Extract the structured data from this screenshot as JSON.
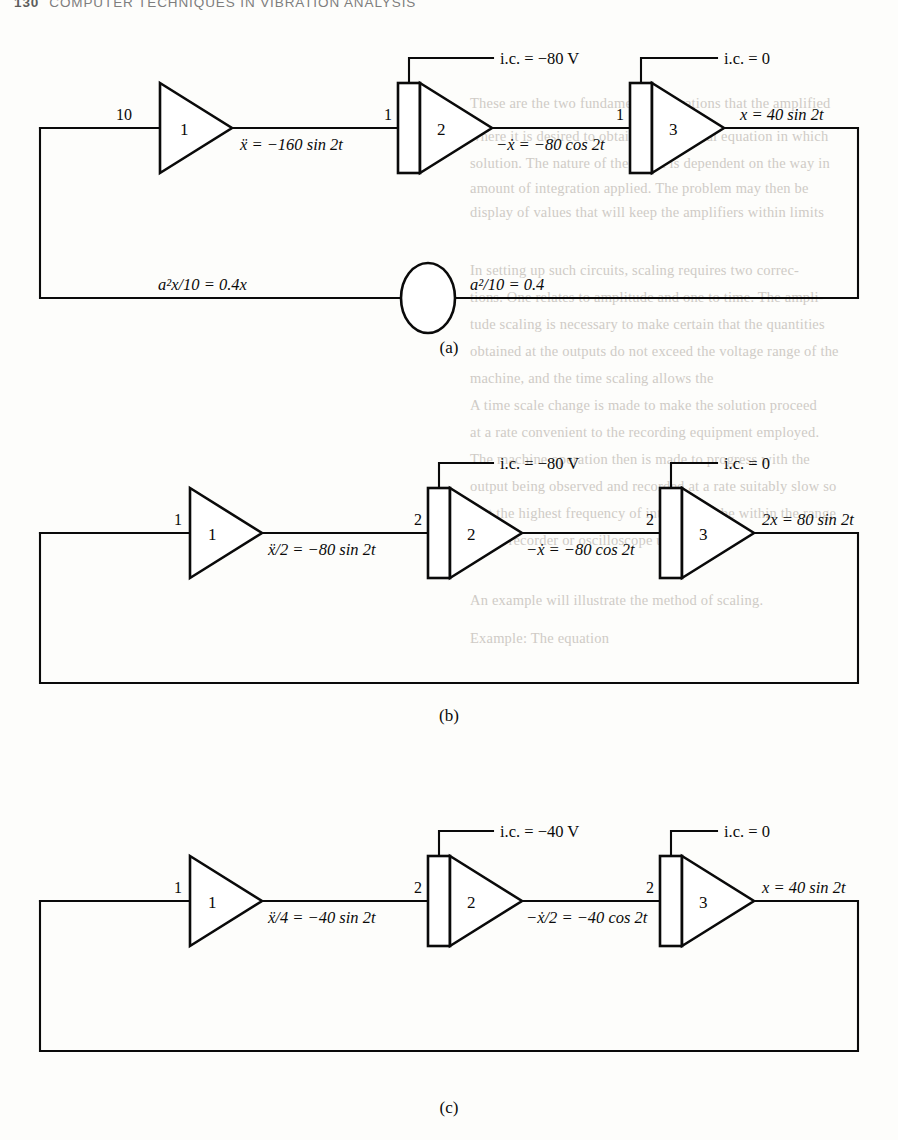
{
  "page": {
    "folio": "130",
    "running_head": "COMPUTER TECHNIQUES IN VIBRATION ANALYSIS",
    "width": 898,
    "height": 1140,
    "ink_color": "#0a0a0a",
    "paper_color": "#fdfdfb"
  },
  "diagrams": [
    {
      "caption": "(a)",
      "input_gain": "10",
      "amplifier": {
        "block_number": "1",
        "output_label": "ẍ = −160 sin 2t"
      },
      "integrator1": {
        "block_number": "2",
        "input_gain": "1",
        "ic_label": "i.c. = −80 V",
        "output_label": "−ẋ = −80 cos 2t"
      },
      "integrator2": {
        "block_number": "3",
        "input_gain": "1",
        "ic_label": "i.c. = 0",
        "output_label": "x = 40 sin 2t"
      },
      "feedback": {
        "left_label": "a²x/10 = 0.4x",
        "right_label": "a²/10 = 0.4",
        "has_potentiometer": true
      }
    },
    {
      "caption": "(b)",
      "input_gain": "1",
      "amplifier": {
        "block_number": "1",
        "output_label": "ẍ/2 = −80 sin 2t"
      },
      "integrator1": {
        "block_number": "2",
        "input_gain": "2",
        "ic_label": "i.c. = −80 V",
        "output_label": "−ẋ = −80 cos 2t"
      },
      "integrator2": {
        "block_number": "3",
        "input_gain": "2",
        "ic_label": "i.c. = 0",
        "output_label": "2x = 80 sin 2t"
      },
      "feedback": {
        "left_label": "",
        "right_label": "",
        "has_potentiometer": false
      }
    },
    {
      "caption": "(c)",
      "input_gain": "1",
      "amplifier": {
        "block_number": "1",
        "output_label": "ẍ/4 = −40 sin 2t"
      },
      "integrator1": {
        "block_number": "2",
        "input_gain": "2",
        "ic_label": "i.c. = −40 V",
        "output_label": "−ẋ/2 = −40 cos 2t"
      },
      "integrator2": {
        "block_number": "3",
        "input_gain": "2",
        "ic_label": "i.c. = 0",
        "output_label": "x = 40 sin 2t"
      },
      "feedback": {
        "left_label": "",
        "right_label": "",
        "has_potentiometer": false
      }
    }
  ],
  "show_through": [
    {
      "text": "These are the two fundamental operations that the amplified",
      "x": 470,
      "y": 95
    },
    {
      "text": "where it is desired to obtain a differential equation in which",
      "x": 470,
      "y": 128
    },
    {
      "text": "solution. The nature of the result is dependent on the way in",
      "x": 470,
      "y": 155
    },
    {
      "text": "amount of integration applied. The problem may then be",
      "x": 470,
      "y": 180
    },
    {
      "text": "display of values that will keep the amplifiers within limits",
      "x": 470,
      "y": 204
    },
    {
      "text": "In setting up such circuits, scaling requires two correc-",
      "x": 470,
      "y": 262
    },
    {
      "text": "tions. One relates to amplitude and one to time. The ampli-",
      "x": 470,
      "y": 289
    },
    {
      "text": "tude scaling is necessary to make certain that the quantities",
      "x": 470,
      "y": 316
    },
    {
      "text": "obtained at the outputs do not exceed the voltage range of the",
      "x": 470,
      "y": 343
    },
    {
      "text": "machine, and the time scaling allows the",
      "x": 470,
      "y": 370
    },
    {
      "text": "A time scale change is made to make the solution proceed",
      "x": 470,
      "y": 397
    },
    {
      "text": "at a rate convenient to the recording equipment employed.",
      "x": 470,
      "y": 424
    },
    {
      "text": "The machine operation then is made to progress with the",
      "x": 470,
      "y": 451
    },
    {
      "text": "output being observed and recorded at a rate suitably slow so",
      "x": 470,
      "y": 478
    },
    {
      "text": "that the highest frequency of interest will be within the range",
      "x": 470,
      "y": 505
    },
    {
      "text": "of the recorder or oscilloscope used.",
      "x": 470,
      "y": 532
    },
    {
      "text": "An example will illustrate the method of scaling.",
      "x": 470,
      "y": 592
    },
    {
      "text": "Example: The equation",
      "x": 470,
      "y": 630
    }
  ]
}
